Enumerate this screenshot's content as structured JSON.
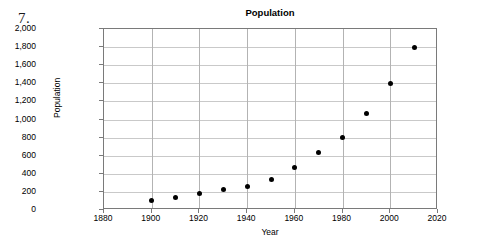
{
  "problem": {
    "number": "7."
  },
  "chart_data": {
    "type": "scatter",
    "title": "Population",
    "xlabel": "Year",
    "ylabel": "Population",
    "xlim": [
      1880,
      2020
    ],
    "ylim": [
      0,
      2000
    ],
    "xticks": [
      1880,
      1900,
      1920,
      1940,
      1960,
      1980,
      2000,
      2020
    ],
    "xtick_labels": [
      "1880",
      "1900",
      "1920",
      "1940",
      "1960",
      "1980",
      "2000",
      "2020"
    ],
    "yticks": [
      0,
      200,
      400,
      600,
      800,
      1000,
      1200,
      1400,
      1600,
      1800,
      2000
    ],
    "ytick_labels": [
      "0",
      "200",
      "400",
      "600",
      "800",
      "1,000",
      "1,200",
      "1,400",
      "1,600",
      "1,800",
      "2,000"
    ],
    "grid": true,
    "legend": false,
    "marker": "filled-circle",
    "marker_color": "#000000",
    "x": [
      1900,
      1910,
      1920,
      1930,
      1940,
      1950,
      1960,
      1970,
      1980,
      1990,
      2000,
      2010
    ],
    "values": [
      100,
      140,
      180,
      230,
      260,
      340,
      470,
      630,
      800,
      1070,
      1400,
      1800
    ],
    "points": [
      {
        "x": 1900,
        "y": 100
      },
      {
        "x": 1910,
        "y": 140
      },
      {
        "x": 1920,
        "y": 180
      },
      {
        "x": 1930,
        "y": 230
      },
      {
        "x": 1940,
        "y": 260
      },
      {
        "x": 1950,
        "y": 340
      },
      {
        "x": 1960,
        "y": 470
      },
      {
        "x": 1970,
        "y": 630
      },
      {
        "x": 1980,
        "y": 800
      },
      {
        "x": 1990,
        "y": 1070
      },
      {
        "x": 2000,
        "y": 1400
      },
      {
        "x": 2010,
        "y": 1800
      }
    ]
  },
  "colors": {
    "plot_border": "#7a7a7a",
    "gridline": "#c9c9c9",
    "marker": "#000000",
    "background": "#ffffff"
  }
}
